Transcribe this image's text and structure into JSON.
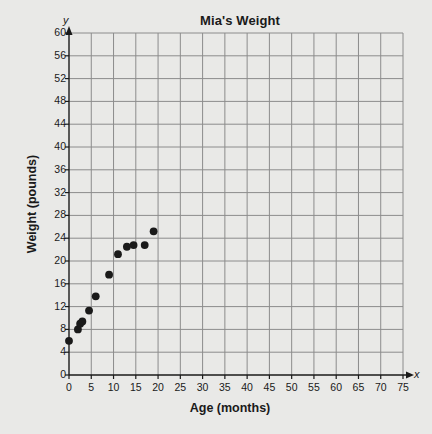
{
  "chart_data": {
    "type": "scatter",
    "title": "Mia's Weight",
    "xlabel": "Age (months)",
    "ylabel": "Weight (pounds)",
    "x_axis_variable": "x",
    "y_axis_variable": "y",
    "xlim": [
      0,
      75
    ],
    "ylim": [
      0,
      60
    ],
    "x_ticks": [
      0,
      5,
      10,
      15,
      20,
      25,
      30,
      35,
      40,
      45,
      50,
      55,
      60,
      65,
      70,
      75
    ],
    "y_ticks": [
      0,
      4,
      8,
      12,
      16,
      20,
      24,
      28,
      32,
      36,
      40,
      44,
      48,
      52,
      56,
      60
    ],
    "grid": true,
    "legend": "none",
    "marker": "filled-circle",
    "marker_color": "#1a1a1a",
    "grid_color": "#8c8c8c",
    "background_color": "#e9e9e7",
    "points": [
      {
        "x": 0,
        "y": 6
      },
      {
        "x": 2,
        "y": 8
      },
      {
        "x": 2.5,
        "y": 9
      },
      {
        "x": 3,
        "y": 9.4
      },
      {
        "x": 4.5,
        "y": 11.3
      },
      {
        "x": 6,
        "y": 13.8
      },
      {
        "x": 9,
        "y": 17.6
      },
      {
        "x": 11,
        "y": 21.2
      },
      {
        "x": 13,
        "y": 22.5
      },
      {
        "x": 14.5,
        "y": 22.8
      },
      {
        "x": 17,
        "y": 22.8
      },
      {
        "x": 19,
        "y": 25.2
      }
    ]
  }
}
